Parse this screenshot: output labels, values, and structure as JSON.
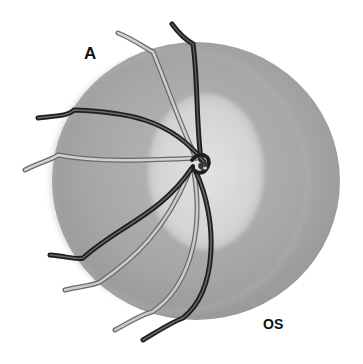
{
  "figure": {
    "panel_label": "A",
    "eye_label": "OS",
    "colors": {
      "background": "#ffffff",
      "disc_outer": "#a9a9a9",
      "disc_cup": "#d6d6d6",
      "vessel_dark": "#2a2a2a",
      "vessel_light": "#bdbdbd"
    }
  }
}
